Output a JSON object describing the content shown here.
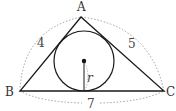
{
  "diagram": {
    "vertices": {
      "A": {
        "label": "A",
        "x": 81,
        "y": 17
      },
      "B": {
        "label": "B",
        "x": 20,
        "y": 91
      },
      "C": {
        "label": "C",
        "x": 164,
        "y": 91
      }
    },
    "sides": {
      "AB": {
        "length_label": "4"
      },
      "AC": {
        "length_label": "5"
      },
      "BC": {
        "length_label": "7"
      }
    },
    "incircle": {
      "cx": 84,
      "cy": 61,
      "radius": 30,
      "radius_label": "r"
    },
    "colors": {
      "stroke": "#1a1a1a",
      "dashed": "#888888",
      "text": "#333333"
    }
  }
}
